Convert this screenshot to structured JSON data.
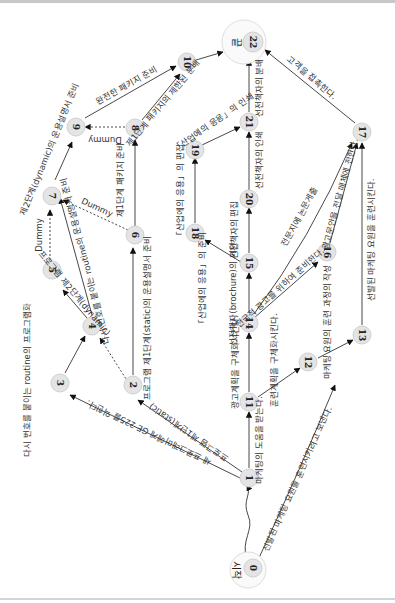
{
  "diagram": {
    "type": "PERT network (rotated 90°)",
    "nodes": [
      {
        "id": "0",
        "label": "0",
        "caption": "시작"
      },
      {
        "id": "1",
        "label": "1"
      },
      {
        "id": "2",
        "label": "2"
      },
      {
        "id": "3",
        "label": "3"
      },
      {
        "id": "4",
        "label": "4"
      },
      {
        "id": "5",
        "label": "5"
      },
      {
        "id": "6",
        "label": "6"
      },
      {
        "id": "7",
        "label": "7"
      },
      {
        "id": "8",
        "label": "8"
      },
      {
        "id": "9",
        "label": "9"
      },
      {
        "id": "10",
        "label": "10"
      },
      {
        "id": "11",
        "label": "11"
      },
      {
        "id": "12",
        "label": "12"
      },
      {
        "id": "13",
        "label": "13"
      },
      {
        "id": "14",
        "label": "14"
      },
      {
        "id": "15",
        "label": "15"
      },
      {
        "id": "16",
        "label": "16"
      },
      {
        "id": "17",
        "label": "17"
      },
      {
        "id": "18",
        "label": "18"
      },
      {
        "id": "19",
        "label": "19"
      },
      {
        "id": "20",
        "label": "20"
      },
      {
        "id": "21",
        "label": "21"
      },
      {
        "id": "22",
        "label": "22",
        "caption": "끝"
      }
    ],
    "edges": [
      {
        "from": "0",
        "to": "1",
        "label": ""
      },
      {
        "from": "0",
        "to": "13",
        "label": "선발된 마케팅 요원을 훈련시키려고 보낸다."
      },
      {
        "from": "1",
        "to": "3",
        "label": "새 프로그래머에게 GE 225를 익힌다."
      },
      {
        "from": "1",
        "to": "2",
        "label": "프로그램 제1단계(static)"
      },
      {
        "from": "1",
        "to": "11",
        "label": "마케팅의 도움을 받는다."
      },
      {
        "from": "2",
        "to": "4",
        "label": "Dummy",
        "dashed": true
      },
      {
        "from": "2",
        "to": "6",
        "label": "프로그램 제1단계(static)의 운용설명서 준비"
      },
      {
        "from": "3",
        "to": "4",
        "label": ""
      },
      {
        "from": "4",
        "to": "5",
        "label": "프로그램 제2단계(dynamic)"
      },
      {
        "from": "4",
        "to": "7",
        "label": "다시 번호를 붙이는 routine의 운용설명서 준비"
      },
      {
        "from": "5",
        "to": "7",
        "label": "Dummy",
        "dashed": true
      },
      {
        "from": "6",
        "to": "7",
        "label": "Dummy",
        "dashed": true
      },
      {
        "from": "6",
        "to": "8",
        "label": "제1단계 패키지 준비"
      },
      {
        "from": "7",
        "to": "9",
        "label": "제2단계(dynamic)의 운용설명서 준비"
      },
      {
        "from": "8",
        "to": "9",
        "label": "Dummy",
        "dashed": true
      },
      {
        "from": "8",
        "to": "10",
        "label": "제1단계 패키지의 제한된 분배"
      },
      {
        "from": "9",
        "to": "10",
        "label": "완전한 패키지 준비"
      },
      {
        "from": "10",
        "to": "22",
        "label": ""
      },
      {
        "from": "11",
        "to": "14",
        "label": "광고계획을 구체화시킨다."
      },
      {
        "from": "11",
        "to": "12",
        "label": "훈련계획을 구체화시킨다."
      },
      {
        "from": "12",
        "to": "13",
        "label": "마케팅 요원의 훈련 과정의 작성"
      },
      {
        "from": "13",
        "to": "17",
        "label": "선발된 마케팅 요원을 훈련시킨다."
      },
      {
        "from": "14",
        "to": "15",
        "label": "선전책자(brochure)의 기안"
      },
      {
        "from": "14",
        "to": "16",
        "label": "전국적 광고를 위하여 준비한다."
      },
      {
        "from": "14",
        "to": "17",
        "label": "전문지에 논문게출"
      },
      {
        "from": "15",
        "to": "18",
        "label": "「산업에의 응용」의 준비"
      },
      {
        "from": "15",
        "to": "20",
        "label": "선전책자의 편집"
      },
      {
        "from": "16",
        "to": "17",
        "label": "광고문안을 전달 매체에 전한다."
      },
      {
        "from": "17",
        "to": "22",
        "label": "고객을 접촉한다."
      },
      {
        "from": "18",
        "to": "19",
        "label": "「산업에의 응용」의 편집"
      },
      {
        "from": "19",
        "to": "21",
        "label": "「산업에의 응용」의 인쇄"
      },
      {
        "from": "20",
        "to": "21",
        "label": "선전책자의 인쇄"
      },
      {
        "from": "21",
        "to": "22",
        "label": "선전책자의 분배"
      }
    ],
    "side_note": "다시 번호를 붙이는 routine의 프로그램화"
  },
  "labels": {
    "start": "시작",
    "end": "끝",
    "e0_13": "선발된 마케팅 요원을 훈련시키려고 보낸다.",
    "e1_3": "새 프로그래머에게 GE 225를 익힌다.",
    "e1_2": "프로그램 제1단계(static)",
    "e1_11": "마케팅의 도움을 받는다.",
    "e2_6": "프로그램 제1단계(static)의 운용설명서 준비",
    "e4_5": "프로그램 제2단계(dynamic)",
    "e4_7": "다시 번호를 붙이는 routine의 운용설명서 준비",
    "e6_8": "제1단계 패키지 준비",
    "e7_9": "제2단계(dynamic)의 운용설명서 준비",
    "e8_10": "제1단계 패키지의 제한된 분배",
    "e9_10": "완전한 패키지 준비",
    "e11_14": "광고계획을 구체화시킨다.",
    "e11_12": "훈련계획을 구체화시킨다.",
    "e12_13": "마케팅 요원의 훈련 과정의 작성",
    "e13_17": "선발된 마케팅 요원을 훈련시킨다.",
    "e14_15": "선전책자(brochure)의 기안",
    "e14_16": "전국적 광고를 위하여 준비한다.",
    "e14_17": "전문지에 논문게출",
    "e15_18": "「산업에의 응용」의 준비",
    "e15_20": "선전책자의 편집",
    "e16_17": "광고문안을 전달 매체에 전한다.",
    "e17_22": "고객을 접촉한다.",
    "e18_19": "「산업에의 응용」의 편집",
    "e19_21": "「산업에의 응용」의 인쇄",
    "e20_21": "선전책자의 인쇄",
    "e21_22": "선전책자의 분배",
    "dummy": "Dummy",
    "side": "다시 번호를 붙이는 routine의 프로그램화"
  }
}
